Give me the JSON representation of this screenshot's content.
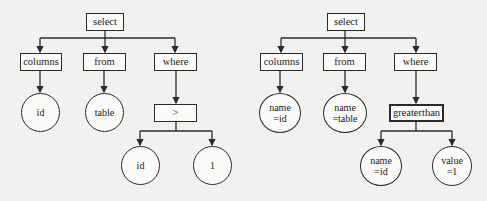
{
  "diagram": {
    "left_tree": {
      "root": "select",
      "children": [
        "columns",
        "from",
        "where"
      ],
      "columns_leaf": "id",
      "from_leaf": "table",
      "where_op": ">",
      "op_left": "id",
      "op_right": "1"
    },
    "right_tree": {
      "root": "select",
      "children": [
        "columns",
        "from",
        "where"
      ],
      "columns_leaf": [
        "name",
        "=id"
      ],
      "from_leaf": [
        "name",
        "=table"
      ],
      "where_op": "greaterthan",
      "op_left": [
        "name",
        "=id"
      ],
      "op_right": [
        "value",
        "=1"
      ]
    },
    "colors": {
      "line": "#2a2a2a",
      "background": "#f1f1ef",
      "node_fill": "#fafaf8"
    }
  }
}
